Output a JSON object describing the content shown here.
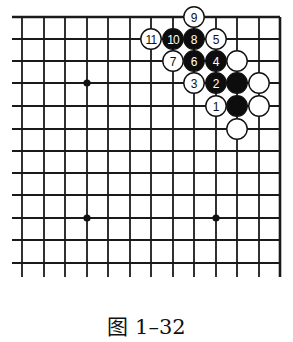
{
  "figure": {
    "caption": "图 1–32"
  },
  "board": {
    "columns": 13,
    "rows": 12,
    "col_x": [
      22,
      44,
      65,
      87,
      108,
      130,
      151,
      173,
      194,
      216,
      237,
      259,
      280
    ],
    "row_y": [
      17,
      39,
      61,
      83,
      106,
      129,
      151,
      173,
      195,
      218,
      240,
      263
    ],
    "left_extend_x": 12,
    "bottom_extend_y": 277,
    "top_edge_closed": true,
    "right_edge_closed": true,
    "line_color": "#1a1a1a",
    "star_points": [
      {
        "col": 3,
        "row": 3
      },
      {
        "col": 3,
        "row": 9
      },
      {
        "col": 9,
        "row": 9
      }
    ],
    "stones": [
      {
        "col": 10,
        "row": 4,
        "color": "black",
        "label": ""
      },
      {
        "col": 9,
        "row": 4,
        "color": "white",
        "label": "1"
      },
      {
        "col": 9,
        "row": 3,
        "color": "black",
        "label": "2"
      },
      {
        "col": 8,
        "row": 3,
        "color": "white",
        "label": "3"
      },
      {
        "col": 9,
        "row": 2,
        "color": "black",
        "label": "4"
      },
      {
        "col": 9,
        "row": 1,
        "color": "white",
        "label": "5"
      },
      {
        "col": 8,
        "row": 2,
        "color": "black",
        "label": "6"
      },
      {
        "col": 7,
        "row": 2,
        "color": "white",
        "label": "7"
      },
      {
        "col": 8,
        "row": 1,
        "color": "black",
        "label": "8"
      },
      {
        "col": 8,
        "row": 0,
        "color": "white",
        "label": "9"
      },
      {
        "col": 7,
        "row": 1,
        "color": "black",
        "label": "10"
      },
      {
        "col": 6,
        "row": 1,
        "color": "white",
        "label": "11"
      },
      {
        "col": 10,
        "row": 2,
        "color": "white",
        "label": ""
      },
      {
        "col": 10,
        "row": 3,
        "color": "black",
        "label": ""
      },
      {
        "col": 11,
        "row": 3,
        "color": "white",
        "label": ""
      },
      {
        "col": 11,
        "row": 4,
        "color": "white",
        "label": ""
      },
      {
        "col": 10,
        "row": 5,
        "color": "white",
        "label": ""
      }
    ]
  }
}
